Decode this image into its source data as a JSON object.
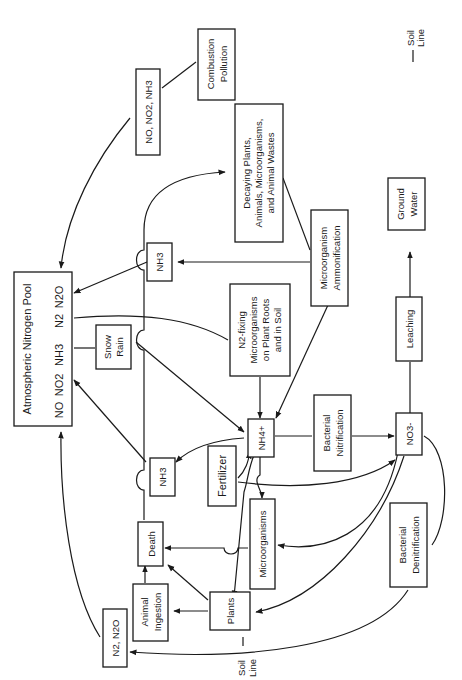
{
  "nodes": {
    "atmospheric_pool": {
      "title": "Atmospheric Nitrogen Pool",
      "species": [
        "NO",
        "NO2",
        "NH3",
        "N2",
        "N2O"
      ]
    },
    "combustion": {
      "lines": [
        "Combustion",
        "Pollution"
      ]
    },
    "no_no2_nh3": {
      "text": "NO, NO2, NH3"
    },
    "nh3_top": {
      "text": "NH3"
    },
    "nh3_mid": {
      "text": "NH3"
    },
    "decaying": {
      "lines": [
        "Decaying Plants,",
        "Animals, Microorganisms,",
        "and Animal Wastes"
      ]
    },
    "ammonification": {
      "lines": [
        "Microorganism",
        "Ammonification"
      ]
    },
    "snow_rain": {
      "lines": [
        "Snow",
        "Rain"
      ]
    },
    "n2_fixing": {
      "lines": [
        "N2-fixing",
        "Microorganisms",
        "on Plant Roots",
        "and in Soil"
      ]
    },
    "nh4": {
      "text": "NH4+"
    },
    "nitrification": {
      "lines": [
        "Bacterial",
        "Nitrification"
      ]
    },
    "no3": {
      "text": "NO3-"
    },
    "leaching": {
      "text": "Leaching"
    },
    "ground_water": {
      "lines": [
        "Ground",
        "Water"
      ]
    },
    "fertilizer": {
      "text": "Fertilizer"
    },
    "microorganisms": {
      "text": "Microorganisms"
    },
    "death": {
      "text": "Death"
    },
    "animal_ingestion": {
      "lines": [
        "Animal",
        "Ingestion"
      ]
    },
    "plants": {
      "text": "Plants"
    },
    "denitrification": {
      "lines": [
        "Bacterial",
        "Denitrification"
      ]
    },
    "n2_n2o": {
      "text": "N2, N2O"
    }
  },
  "legend": {
    "soil_line": [
      "Soil",
      "Line"
    ]
  },
  "soil_line_bottom": [
    "Soil",
    "Line"
  ]
}
